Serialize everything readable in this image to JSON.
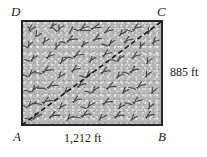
{
  "figure": {
    "kind": "geometry-diagram",
    "shape": "rectangle"
  },
  "vertices": {
    "top_left": "D",
    "top_right": "C",
    "bottom_left": "A",
    "bottom_right": "B"
  },
  "dimensions": {
    "width_label": "1,212 ft",
    "height_label": "885 ft",
    "width_value": 1212,
    "height_value": 885,
    "unit": "ft"
  },
  "diagonal": {
    "from": "A",
    "to": "C",
    "style": "dashed"
  },
  "colors": {
    "field_fill": "#b4b4b4",
    "border": "#262626",
    "vegetation": "#3c3c3c",
    "text": "#1a1a1a",
    "page_background": "#ffffff"
  }
}
